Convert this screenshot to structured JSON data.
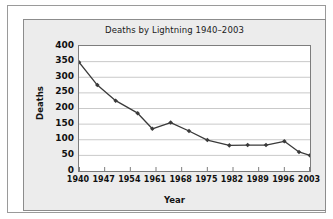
{
  "chart_data": {
    "type": "line",
    "title": "Deaths by Lightning 1940–2003",
    "xlabel": "Year",
    "ylabel": "Deaths",
    "xlim": [
      1940,
      2003
    ],
    "ylim": [
      0,
      400
    ],
    "ytick_labels": [
      "400",
      "350",
      "300",
      "250",
      "200",
      "150",
      "100",
      "50",
      "0"
    ],
    "ytick_values": [
      400,
      350,
      300,
      250,
      200,
      150,
      100,
      50,
      0
    ],
    "xtick_labels": [
      "1940",
      "1947",
      "1954",
      "1961",
      "1968",
      "1975",
      "1982",
      "1989",
      "1996",
      "2003"
    ],
    "xtick_values": [
      1940,
      1947,
      1954,
      1961,
      1968,
      1975,
      1982,
      1989,
      1996,
      2003
    ],
    "grid": "horizontal",
    "legend": "none",
    "marker": "diamond",
    "line_color": "#3a3a3a",
    "x": [
      1940,
      1945,
      1950,
      1956,
      1960,
      1965,
      1970,
      1975,
      1981,
      1986,
      1991,
      1996,
      2000,
      2003
    ],
    "values": [
      348,
      275,
      225,
      185,
      135,
      155,
      128,
      99,
      82,
      83,
      83,
      95,
      61,
      50
    ],
    "series": [
      {
        "name": "Deaths",
        "points": [
          {
            "year": 1940,
            "deaths": 348
          },
          {
            "year": 1945,
            "deaths": 275
          },
          {
            "year": 1950,
            "deaths": 225
          },
          {
            "year": 1956,
            "deaths": 185
          },
          {
            "year": 1960,
            "deaths": 135
          },
          {
            "year": 1965,
            "deaths": 155
          },
          {
            "year": 1970,
            "deaths": 128
          },
          {
            "year": 1975,
            "deaths": 99
          },
          {
            "year": 1981,
            "deaths": 82
          },
          {
            "year": 1986,
            "deaths": 83
          },
          {
            "year": 1991,
            "deaths": 83
          },
          {
            "year": 1996,
            "deaths": 95
          },
          {
            "year": 2000,
            "deaths": 61
          },
          {
            "year": 2003,
            "deaths": 50
          }
        ]
      }
    ]
  },
  "colors": {
    "panel_background": "#ececec",
    "plot_background": "#ffffff",
    "gridline": "#c9c9c9",
    "axis": "#7d7d7d",
    "series": "#3a3a3a",
    "text": "#141414"
  }
}
